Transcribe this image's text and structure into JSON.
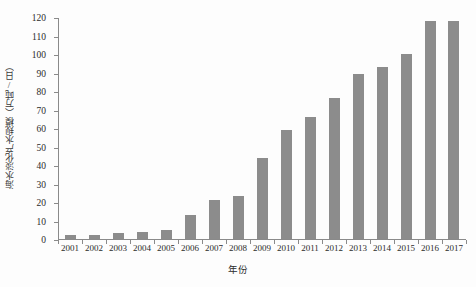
{
  "chart_data": {
    "type": "bar",
    "title": "",
    "xlabel": "年份",
    "ylabel": "海水淡化产水规模（万吨/日）",
    "categories": [
      "2001",
      "2002",
      "2003",
      "2004",
      "2005",
      "2006",
      "2007",
      "2008",
      "2009",
      "2010",
      "2011",
      "2012",
      "2013",
      "2014",
      "2015",
      "2016",
      "2017"
    ],
    "values": [
      2,
      2,
      3,
      4,
      5,
      13,
      21,
      23,
      44,
      59,
      66,
      76,
      89,
      93,
      100,
      118,
      118
    ],
    "series": [
      {
        "name": "海水淡化产水规模",
        "values": [
          2,
          2,
          3,
          4,
          5,
          13,
          21,
          23,
          44,
          59,
          66,
          76,
          89,
          93,
          100,
          118,
          118
        ]
      }
    ],
    "ylim": [
      0,
      120
    ],
    "ytick_values": [
      0,
      10,
      20,
      30,
      40,
      50,
      60,
      70,
      80,
      90,
      100,
      110,
      120
    ],
    "ytick_labels": [
      "0",
      "10",
      "20",
      "30",
      "40",
      "50",
      "60",
      "70",
      "80",
      "90",
      "100",
      "110",
      "120"
    ],
    "grid": false,
    "legend": false,
    "legend_position": "none",
    "bar_color": "#8c8c8c",
    "axis_color": "#8a8a8a",
    "background_color": "#fdfdfd"
  }
}
